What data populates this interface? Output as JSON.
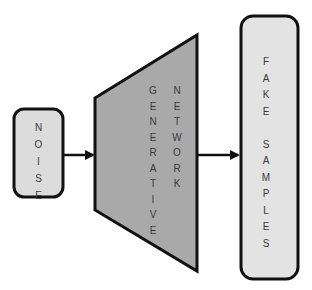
{
  "diagram": {
    "type": "GAN generator flow",
    "nodes": [
      {
        "id": "noise",
        "label": "NOISE",
        "shape": "rounded-rect",
        "fill": "#dcdcdc"
      },
      {
        "id": "generator",
        "label_lines": [
          "GENERATIVE",
          "NETWORK"
        ],
        "shape": "trapezoid",
        "fill": "#a9a9a9"
      },
      {
        "id": "fake_samples",
        "label_lines": [
          "FAKE",
          "SAMPLES"
        ],
        "shape": "rounded-rect",
        "fill": "#e3e3e3"
      }
    ],
    "edges": [
      {
        "from": "noise",
        "to": "generator"
      },
      {
        "from": "generator",
        "to": "fake_samples"
      }
    ],
    "colors": {
      "stroke": "#111111",
      "text": "#3a3a3a",
      "background": "#ffffff"
    }
  }
}
